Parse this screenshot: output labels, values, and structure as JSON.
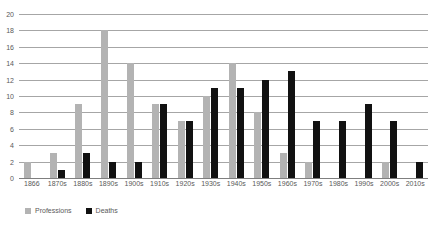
{
  "chart_data": {
    "type": "bar",
    "title": "",
    "xlabel": "",
    "ylabel": "",
    "ylim": [
      0,
      20
    ],
    "ytick_step": 2,
    "yticks": [
      20,
      18,
      16,
      14,
      12,
      10,
      8,
      6,
      4,
      2,
      0
    ],
    "grid": true,
    "legend_position": "bottom-left",
    "categories": [
      "1866",
      "1870s",
      "1880s",
      "1890s",
      "1900s",
      "1910s",
      "1920s",
      "1930s",
      "1940s",
      "1950s",
      "1960s",
      "1970s",
      "1980s",
      "1990s",
      "2000s",
      "2010s"
    ],
    "series": [
      {
        "name": "Professions",
        "color": "#b3b3b3",
        "values": [
          2,
          3,
          9,
          18,
          14,
          9,
          7,
          10,
          14,
          8,
          3,
          2,
          0,
          0,
          2,
          0
        ]
      },
      {
        "name": "Deaths",
        "color": "#111111",
        "values": [
          0,
          1,
          3,
          2,
          2,
          9,
          7,
          11,
          11,
          12,
          13,
          7,
          7,
          9,
          7,
          2
        ]
      }
    ]
  },
  "legend": {
    "items": [
      {
        "label": "Professions",
        "swatch": "prof"
      },
      {
        "label": "Deaths",
        "swatch": "death"
      }
    ]
  }
}
